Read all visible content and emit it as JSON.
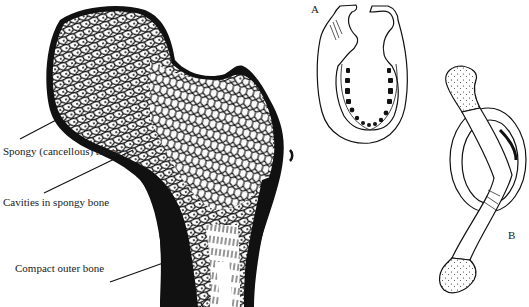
{
  "figure": {
    "femur": {
      "labels": {
        "spongy_tissue": "Spongy (cancellous) tissue",
        "cavities": "Cavities in spongy bone",
        "compact_bone": "Compact outer bone"
      }
    },
    "panel_a": {
      "letter": "A",
      "subject": "mandible (lower jaw) with teeth sockets"
    },
    "panel_b": {
      "letter": "B",
      "subject": "clavicle bent into a loop"
    }
  },
  "colors": {
    "ink": "#111111",
    "paper": "#ffffff"
  }
}
